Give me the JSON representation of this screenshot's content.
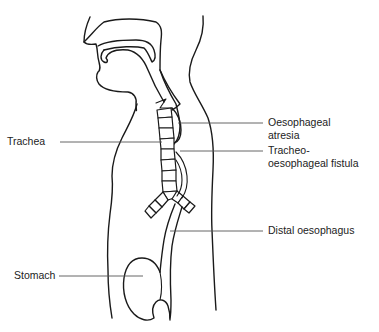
{
  "figure": {
    "labels": {
      "trachea": "Trachea",
      "oesophageal_atresia_line1": "Oesophageal",
      "oesophageal_atresia_line2": "atresia",
      "fistula_line1": "Tracheo-",
      "fistula_line2": "oesophageal fistula",
      "distal_oesophagus": "Distal oesophagus",
      "stomach": "Stomach"
    },
    "colors": {
      "line": "#1a1a1a",
      "leader": "#555555",
      "text": "#222222",
      "background": "#ffffff"
    }
  }
}
